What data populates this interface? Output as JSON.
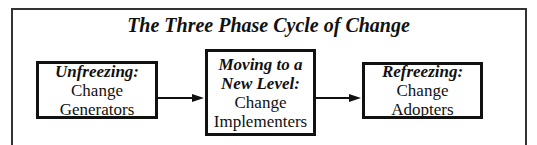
{
  "diagram": {
    "title": "The Three Phase Cycle of Change",
    "nodes": [
      {
        "heading": "Unfreezing:",
        "lines": [
          "Change",
          "Generators"
        ]
      },
      {
        "heading_lines": [
          "Moving to a",
          "New Level:"
        ],
        "lines": [
          "Change",
          "Implementers"
        ]
      },
      {
        "heading": "Refreezing:",
        "lines": [
          "Change",
          "Adopters"
        ]
      }
    ],
    "edges": [
      {
        "from": 0,
        "to": 1
      },
      {
        "from": 1,
        "to": 2
      }
    ]
  }
}
